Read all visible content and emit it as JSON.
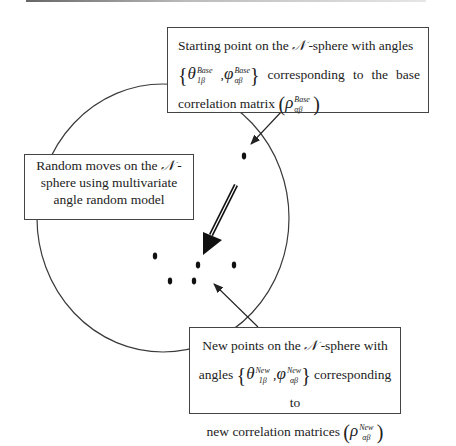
{
  "diagram": {
    "type": "concept-diagram",
    "sphere": {
      "label_symbol": "𝒩",
      "shape": "ellipse-outline",
      "stroke": "#3a3a3a"
    },
    "starting_box": {
      "line1": "Starting point on the ",
      "symbol": "𝒩",
      "line1_rest": " -sphere with angles",
      "theta": "θ",
      "theta_sub": "1β",
      "theta_sup": "Base",
      "phi": "φ",
      "phi_sub": "αβ",
      "phi_sup": "Base",
      "line2_rest": "corresponding to the base",
      "line3": "correlation matrix ",
      "rho": "ρ",
      "rho_sub": "αβ",
      "rho_sup": "Base"
    },
    "random_box": {
      "line1": "Random moves on the ",
      "symbol": "𝒩",
      "line1_rest": " -",
      "line2": "sphere using multivariate",
      "line3": "angle random model"
    },
    "new_box": {
      "line1": "New points on the ",
      "symbol": "𝒩",
      "line1_rest": " -sphere with",
      "line2_prefix": "angles ",
      "theta": "θ",
      "theta_sub": "1β",
      "theta_sup": "New",
      "phi": "φ",
      "phi_sub": "αβ",
      "phi_sup": "New",
      "line2_rest": " corresponding to",
      "line3": "new correlation matrices ",
      "rho": "ρ",
      "rho_sub": "αβ",
      "rho_sup": "New"
    },
    "points": {
      "base_point": {
        "x": 244,
        "y": 156
      },
      "new_points": [
        {
          "x": 155,
          "y": 256
        },
        {
          "x": 198,
          "y": 265
        },
        {
          "x": 234,
          "y": 265
        },
        {
          "x": 170,
          "y": 281
        },
        {
          "x": 194,
          "y": 281
        }
      ]
    },
    "arrows": [
      {
        "name": "base-pointer",
        "from": "starting_box",
        "to": "base_point"
      },
      {
        "name": "random-move",
        "from": "base_point",
        "to": "new_points",
        "style": "bold"
      },
      {
        "name": "new-pointer",
        "from": "new_box",
        "to": "new_points"
      }
    ]
  }
}
